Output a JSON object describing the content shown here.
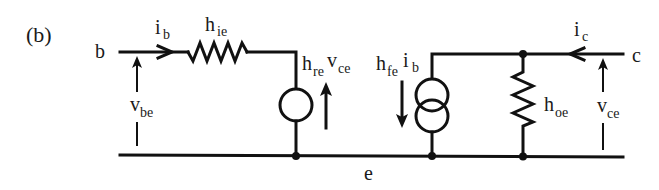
{
  "figure": {
    "label": "(b)"
  },
  "terminals": {
    "base": "b",
    "collector": "c",
    "emitter": "e"
  },
  "currents": {
    "base": {
      "main": "i",
      "sub": "b"
    },
    "collector": {
      "main": "i",
      "sub": "c"
    }
  },
  "voltages": {
    "input": {
      "main": "v",
      "sub": "be"
    },
    "output": {
      "main": "v",
      "sub": "ce"
    }
  },
  "components": {
    "input_resistance": {
      "main": "h",
      "sub": "ie"
    },
    "reverse_voltage_source": {
      "main1": "h",
      "sub1": "re",
      "main2": "v",
      "sub2": "ce"
    },
    "forward_current_source": {
      "main1": "h",
      "sub1": "fe",
      "main2": "i",
      "sub2": "b"
    },
    "output_admittance": {
      "main": "h",
      "sub": "oe"
    }
  },
  "colors": {
    "ink": "#111111",
    "background": "#ffffff"
  }
}
